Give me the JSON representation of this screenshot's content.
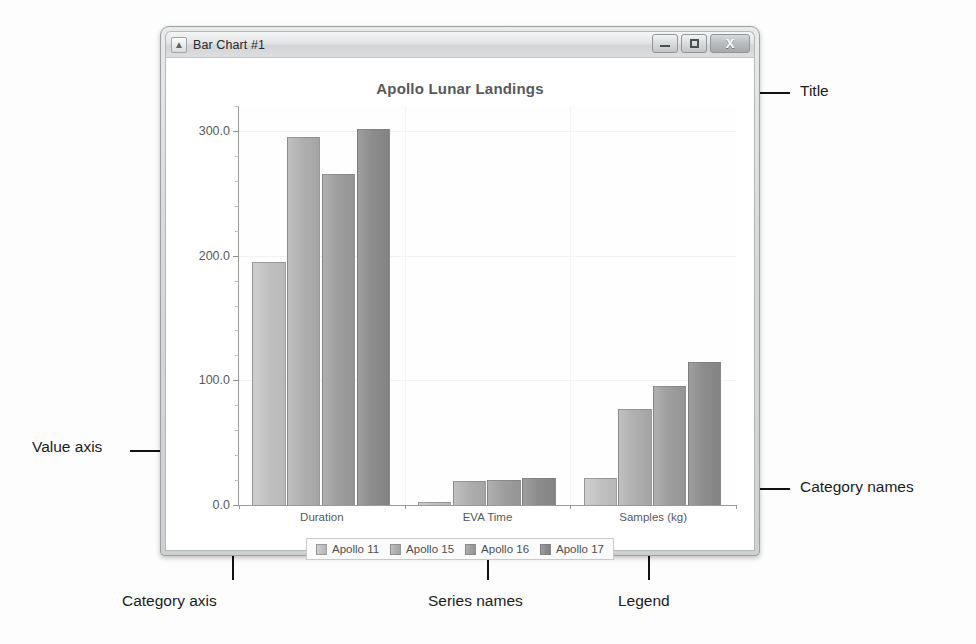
{
  "window": {
    "title": "Bar Chart #1",
    "app_icon": "chart-app-icon",
    "buttons": {
      "minimize": "minimize-icon",
      "maximize": "maximize-icon",
      "close": "X"
    }
  },
  "annotations": [
    {
      "id": "title",
      "label": "Title"
    },
    {
      "id": "category-names",
      "label": "Category names"
    },
    {
      "id": "value-axis",
      "label": "Value axis"
    },
    {
      "id": "category-axis",
      "label": "Category axis"
    },
    {
      "id": "series-names",
      "label": "Series names"
    },
    {
      "id": "legend",
      "label": "Legend"
    }
  ],
  "chart_data": {
    "type": "bar",
    "title": "Apollo Lunar Landings",
    "xlabel": "",
    "ylabel": "",
    "categories": [
      "Duration",
      "EVA Time",
      "Samples (kg)"
    ],
    "series": [
      {
        "name": "Apollo 11",
        "color": "#c2c2c2",
        "values": [
          195.0,
          2.5,
          21.5
        ]
      },
      {
        "name": "Apollo 15",
        "color": "#b0b0b0",
        "values": [
          295.0,
          19.1,
          77.0
        ]
      },
      {
        "name": "Apollo 16",
        "color": "#9f9f9f",
        "values": [
          265.8,
          20.2,
          95.8
        ]
      },
      {
        "name": "Apollo 17",
        "color": "#8d8d8d",
        "values": [
          301.8,
          22.0,
          115.0
        ]
      }
    ],
    "ylim": [
      0.0,
      320.0
    ],
    "yticks": [
      0.0,
      100.0,
      200.0,
      300.0
    ],
    "ytick_labels": [
      "0.0",
      "100.0",
      "200.0",
      "300.0"
    ],
    "yminor_count": 4,
    "grid": true,
    "legend_position": "bottom"
  }
}
